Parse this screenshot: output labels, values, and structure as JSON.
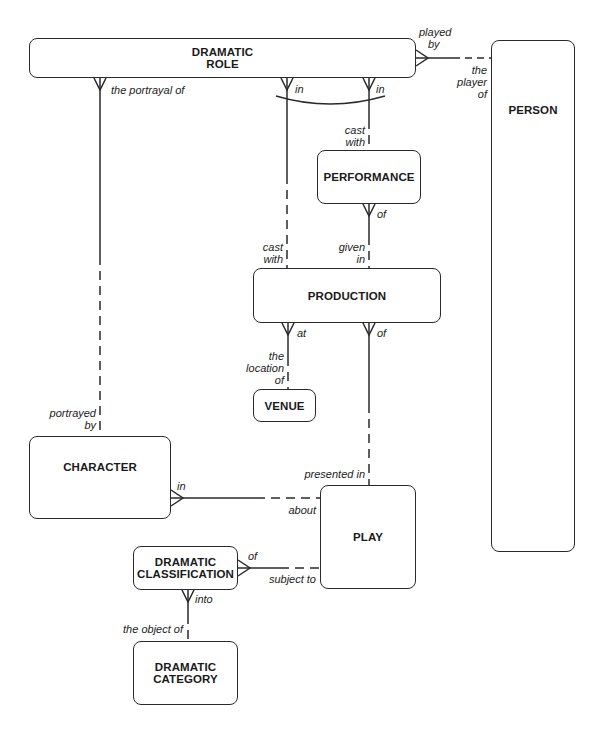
{
  "entities": {
    "dramatic_role": {
      "line1": "DRAMATIC",
      "line2": "ROLE"
    },
    "person": {
      "name": "PERSON"
    },
    "performance": {
      "name": "PERFORMANCE"
    },
    "production": {
      "name": "PRODUCTION"
    },
    "venue": {
      "name": "VENUE"
    },
    "character": {
      "name": "CHARACTER"
    },
    "play": {
      "name": "PLAY"
    },
    "dramatic_classification": {
      "line1": "DRAMATIC",
      "line2": "CLASSIFICATION"
    },
    "dramatic_category": {
      "line1": "DRAMATIC",
      "line2": "CATEGORY"
    }
  },
  "relationships": {
    "role_person": {
      "from_label_1": "played",
      "from_label_2": "by",
      "to_label_1": "the",
      "to_label_2": "player",
      "to_label_3": "of"
    },
    "role_character": {
      "from_label": "the portrayal of",
      "to_label_1": "portrayed",
      "to_label_2": "by"
    },
    "role_production": {
      "from_label": "in",
      "to_label_1": "cast",
      "to_label_2": "with"
    },
    "role_performance": {
      "from_label": "in",
      "to_label_1": "cast",
      "to_label_2": "with"
    },
    "performance_production": {
      "from_label": "of",
      "to_label_1": "given",
      "to_label_2": "in"
    },
    "production_venue": {
      "from_label": "at",
      "to_label_1": "the",
      "to_label_2": "location",
      "to_label_3": "of"
    },
    "production_play": {
      "from_label": "of",
      "to_label": "presented in"
    },
    "character_play": {
      "from_label": "in",
      "to_label": "about"
    },
    "classification_play": {
      "from_label": "of",
      "to_label": "subject to"
    },
    "classification_category": {
      "from_label": "into",
      "to_label": "the object of"
    }
  },
  "colors": {
    "line": "#2a2a2a",
    "background": "#ffffff"
  }
}
